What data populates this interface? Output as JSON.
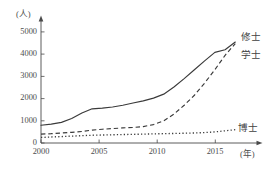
{
  "chart_data": {
    "type": "line",
    "title": "",
    "subtitle": "",
    "xlabel": "(年)",
    "ylabel": "(人)",
    "xlim": [
      2000,
      2019
    ],
    "ylim": [
      0,
      5400
    ],
    "grid": false,
    "legend_position": "right-inline-labels",
    "y_ticks": [
      0,
      1000,
      2000,
      3000,
      4000,
      5000
    ],
    "y_tick_labels": [
      "0",
      "1000",
      "2000",
      "3000",
      "4000",
      "5000"
    ],
    "x_ticks": [
      2000,
      2005,
      2010,
      2015
    ],
    "x_tick_labels": [
      "2000",
      "2005",
      "2010",
      "2015"
    ],
    "x": [
      2000,
      2001,
      2002,
      2003,
      2004,
      2005,
      2006,
      2007,
      2008,
      2009,
      2010,
      2011,
      2012,
      2013,
      2014,
      2015,
      2016,
      2017,
      2018,
      2019
    ],
    "series": [
      {
        "name": "修士",
        "style": "solid",
        "label_position": "above-right-end",
        "values": [
          800,
          850,
          930,
          1100,
          1350,
          1540,
          1570,
          1620,
          1700,
          1800,
          1900,
          2020,
          2200,
          2520,
          2900,
          3300,
          3700,
          4080,
          4200,
          4550
        ]
      },
      {
        "name": "学士",
        "style": "dashed",
        "label_position": "below-right-end",
        "values": [
          400,
          420,
          450,
          480,
          520,
          580,
          620,
          650,
          680,
          700,
          740,
          830,
          1000,
          1300,
          1700,
          2150,
          2700,
          3300,
          3950,
          4480
        ]
      },
      {
        "name": "博士",
        "style": "dotted",
        "label_position": "right-end",
        "values": [
          250,
          270,
          290,
          310,
          330,
          350,
          360,
          370,
          380,
          390,
          400,
          410,
          420,
          430,
          440,
          450,
          470,
          500,
          550,
          600
        ]
      }
    ]
  },
  "axis": {
    "y_unit": "(人)",
    "x_unit": "(年)"
  }
}
